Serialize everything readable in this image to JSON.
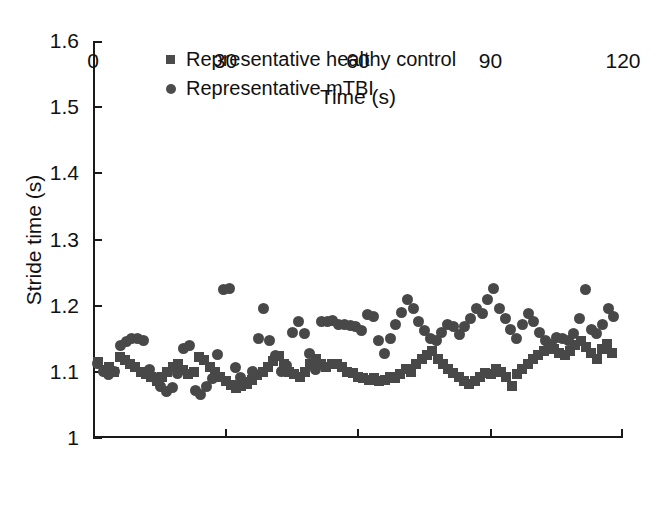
{
  "chart_data": {
    "type": "scatter",
    "title": "",
    "xlabel": "Time (s)",
    "ylabel": "Stride time (s)",
    "xlim": [
      0,
      120
    ],
    "ylim": [
      1.0,
      1.6
    ],
    "xticks": [
      "0",
      "30",
      "60",
      "90",
      "120"
    ],
    "xtick_values": [
      0,
      30,
      60,
      90,
      120
    ],
    "yticks": [
      "1",
      "1.1",
      "1.2",
      "1.3",
      "1.4",
      "1.5",
      "1.6"
    ],
    "ytick_values": [
      1.0,
      1.1,
      1.2,
      1.3,
      1.4,
      1.5,
      1.6
    ],
    "grid": false,
    "legend_position": "upper-left-inside",
    "marker_color": "#484848",
    "series": [
      {
        "name": "Representative healthy control",
        "marker": "square",
        "color": "#484848",
        "points": [
          [
            1.2,
            1.115
          ],
          [
            2.4,
            1.103
          ],
          [
            3.6,
            1.108
          ],
          [
            4.8,
            1.1
          ],
          [
            6.0,
            1.122
          ],
          [
            7.2,
            1.118
          ],
          [
            8.4,
            1.112
          ],
          [
            9.6,
            1.108
          ],
          [
            10.8,
            1.1
          ],
          [
            12.0,
            1.096
          ],
          [
            13.2,
            1.092
          ],
          [
            14.4,
            1.086
          ],
          [
            15.6,
            1.092
          ],
          [
            16.8,
            1.1
          ],
          [
            18.0,
            1.108
          ],
          [
            19.2,
            1.112
          ],
          [
            20.4,
            1.103
          ],
          [
            21.6,
            1.096
          ],
          [
            22.8,
            1.1
          ],
          [
            24.0,
            1.122
          ],
          [
            25.2,
            1.118
          ],
          [
            26.4,
            1.108
          ],
          [
            27.6,
            1.1
          ],
          [
            28.8,
            1.092
          ],
          [
            30.0,
            1.086
          ],
          [
            31.2,
            1.08
          ],
          [
            32.4,
            1.075
          ],
          [
            33.6,
            1.078
          ],
          [
            34.8,
            1.082
          ],
          [
            36.0,
            1.088
          ],
          [
            37.2,
            1.095
          ],
          [
            38.4,
            1.1
          ],
          [
            39.6,
            1.108
          ],
          [
            40.8,
            1.117
          ],
          [
            42.0,
            1.124
          ],
          [
            43.2,
            1.112
          ],
          [
            44.4,
            1.1
          ],
          [
            45.6,
            1.096
          ],
          [
            46.8,
            1.092
          ],
          [
            48.0,
            1.1
          ],
          [
            49.2,
            1.112
          ],
          [
            50.4,
            1.12
          ],
          [
            51.6,
            1.112
          ],
          [
            52.8,
            1.108
          ],
          [
            54.0,
            1.112
          ],
          [
            55.2,
            1.112
          ],
          [
            56.4,
            1.108
          ],
          [
            57.6,
            1.1
          ],
          [
            58.8,
            1.098
          ],
          [
            60.0,
            1.092
          ],
          [
            61.2,
            1.09
          ],
          [
            62.4,
            1.088
          ],
          [
            63.6,
            1.09
          ],
          [
            64.8,
            1.086
          ],
          [
            66.0,
            1.088
          ],
          [
            67.2,
            1.092
          ],
          [
            68.4,
            1.09
          ],
          [
            69.6,
            1.096
          ],
          [
            70.8,
            1.104
          ],
          [
            72.0,
            1.1
          ],
          [
            73.2,
            1.112
          ],
          [
            74.4,
            1.12
          ],
          [
            75.6,
            1.126
          ],
          [
            76.8,
            1.132
          ],
          [
            78.0,
            1.12
          ],
          [
            79.2,
            1.112
          ],
          [
            80.4,
            1.104
          ],
          [
            81.6,
            1.098
          ],
          [
            82.8,
            1.092
          ],
          [
            84.0,
            1.086
          ],
          [
            85.2,
            1.082
          ],
          [
            86.4,
            1.086
          ],
          [
            87.6,
            1.092
          ],
          [
            88.8,
            1.098
          ],
          [
            90.0,
            1.096
          ],
          [
            91.2,
            1.104
          ],
          [
            92.4,
            1.1
          ],
          [
            93.6,
            1.092
          ],
          [
            94.8,
            1.078
          ],
          [
            96.0,
            1.096
          ],
          [
            97.2,
            1.104
          ],
          [
            98.4,
            1.112
          ],
          [
            99.6,
            1.12
          ],
          [
            100.8,
            1.126
          ],
          [
            102.0,
            1.132
          ],
          [
            103.2,
            1.14
          ],
          [
            104.4,
            1.134
          ],
          [
            105.6,
            1.128
          ],
          [
            106.8,
            1.126
          ],
          [
            108.0,
            1.132
          ],
          [
            109.2,
            1.14
          ],
          [
            110.4,
            1.146
          ],
          [
            111.6,
            1.138
          ],
          [
            112.8,
            1.128
          ],
          [
            114.0,
            1.12
          ],
          [
            115.2,
            1.134
          ],
          [
            116.4,
            1.142
          ],
          [
            117.6,
            1.128
          ]
        ]
      },
      {
        "name": "Representative mTBI",
        "marker": "circle",
        "color": "#484848",
        "points": [
          [
            1.0,
            1.112
          ],
          [
            2.3,
            1.1
          ],
          [
            3.6,
            1.096
          ],
          [
            4.9,
            1.1
          ],
          [
            6.2,
            1.14
          ],
          [
            7.5,
            1.146
          ],
          [
            8.8,
            1.15
          ],
          [
            10.1,
            1.15
          ],
          [
            11.4,
            1.148
          ],
          [
            12.7,
            1.104
          ],
          [
            14.0,
            1.092
          ],
          [
            15.3,
            1.078
          ],
          [
            16.6,
            1.07
          ],
          [
            17.9,
            1.076
          ],
          [
            19.2,
            1.098
          ],
          [
            20.5,
            1.136
          ],
          [
            21.8,
            1.14
          ],
          [
            23.1,
            1.072
          ],
          [
            24.4,
            1.066
          ],
          [
            25.7,
            1.078
          ],
          [
            27.0,
            1.09
          ],
          [
            28.3,
            1.126
          ],
          [
            29.6,
            1.224
          ],
          [
            30.9,
            1.226
          ],
          [
            32.2,
            1.106
          ],
          [
            33.5,
            1.092
          ],
          [
            34.8,
            1.084
          ],
          [
            36.1,
            1.1
          ],
          [
            37.4,
            1.15
          ],
          [
            38.7,
            1.196
          ],
          [
            40.0,
            1.148
          ],
          [
            41.3,
            1.124
          ],
          [
            42.6,
            1.1
          ],
          [
            43.9,
            1.11
          ],
          [
            45.2,
            1.16
          ],
          [
            46.5,
            1.176
          ],
          [
            47.8,
            1.158
          ],
          [
            49.1,
            1.128
          ],
          [
            50.4,
            1.104
          ],
          [
            51.7,
            1.176
          ],
          [
            53.0,
            1.176
          ],
          [
            54.3,
            1.178
          ],
          [
            55.6,
            1.172
          ],
          [
            56.9,
            1.172
          ],
          [
            58.2,
            1.17
          ],
          [
            59.5,
            1.168
          ],
          [
            60.8,
            1.162
          ],
          [
            62.1,
            1.186
          ],
          [
            63.4,
            1.184
          ],
          [
            64.7,
            1.148
          ],
          [
            66.0,
            1.128
          ],
          [
            67.3,
            1.15
          ],
          [
            68.6,
            1.172
          ],
          [
            69.9,
            1.19
          ],
          [
            71.2,
            1.21
          ],
          [
            72.5,
            1.196
          ],
          [
            73.8,
            1.176
          ],
          [
            75.1,
            1.162
          ],
          [
            76.4,
            1.15
          ],
          [
            77.7,
            1.148
          ],
          [
            79.0,
            1.16
          ],
          [
            80.3,
            1.172
          ],
          [
            81.6,
            1.168
          ],
          [
            82.9,
            1.156
          ],
          [
            84.2,
            1.168
          ],
          [
            85.5,
            1.18
          ],
          [
            86.8,
            1.196
          ],
          [
            88.1,
            1.188
          ],
          [
            89.4,
            1.21
          ],
          [
            90.7,
            1.226
          ],
          [
            92.0,
            1.196
          ],
          [
            93.3,
            1.18
          ],
          [
            94.6,
            1.164
          ],
          [
            95.9,
            1.15
          ],
          [
            97.2,
            1.172
          ],
          [
            98.5,
            1.188
          ],
          [
            99.8,
            1.176
          ],
          [
            101.1,
            1.16
          ],
          [
            102.4,
            1.148
          ],
          [
            103.7,
            1.142
          ],
          [
            105.0,
            1.152
          ],
          [
            106.3,
            1.15
          ],
          [
            107.6,
            1.148
          ],
          [
            108.9,
            1.158
          ],
          [
            110.2,
            1.18
          ],
          [
            111.5,
            1.224
          ],
          [
            112.8,
            1.164
          ],
          [
            114.1,
            1.158
          ],
          [
            115.4,
            1.172
          ],
          [
            116.7,
            1.196
          ],
          [
            117.9,
            1.184
          ]
        ]
      }
    ]
  },
  "legend": {
    "items": [
      {
        "label": "Representative healthy control",
        "marker": "square"
      },
      {
        "label": "Representative mTBI",
        "marker": "circle"
      }
    ]
  }
}
